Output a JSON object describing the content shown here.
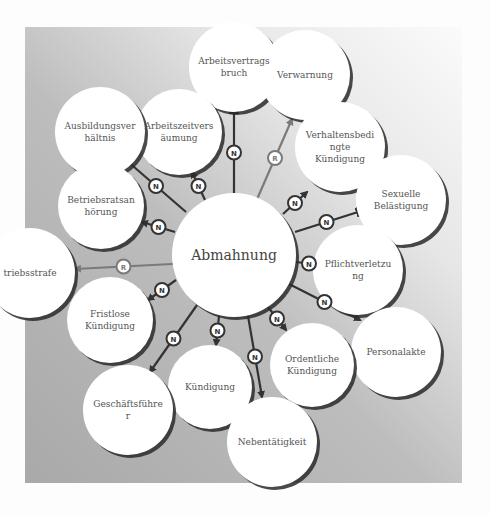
{
  "diagram": {
    "title": "Abmahnung",
    "center": {
      "id": "abmahnung",
      "label": "Abmahnung",
      "cx": 234,
      "cy": 255,
      "r": 62
    },
    "nodes": [
      {
        "id": "arbeitsvertragsbruch",
        "label": "Arbeitsvertrags\nbruch",
        "cx": 234,
        "cy": 67,
        "r": 45
      },
      {
        "id": "verwarnung",
        "label": "Verwarnung",
        "cx": 305,
        "cy": 75,
        "r": 45
      },
      {
        "id": "arbeitszeitversaeumung",
        "label": "Arbeitszeitvers\näumung",
        "cx": 179,
        "cy": 132,
        "r": 43
      },
      {
        "id": "ausbildungsverhaeltnis",
        "label": "Ausbildungsver\nhältnis",
        "cx": 100,
        "cy": 132,
        "r": 45
      },
      {
        "id": "verhaltensbedingte-kuendigung",
        "label": "Verhaltensbedi\nngte\nKündigung",
        "cx": 340,
        "cy": 147,
        "r": 45
      },
      {
        "id": "sexuelle-belaestigung",
        "label": "Sexuelle\nBelästigung",
        "cx": 401,
        "cy": 200,
        "r": 45
      },
      {
        "id": "betriebsratsanhoerung",
        "label": "Betriebsratsan\nhörung",
        "cx": 101,
        "cy": 206,
        "r": 43
      },
      {
        "id": "pflichtverletzung",
        "label": "Pflichtverletzu\nng",
        "cx": 358,
        "cy": 270,
        "r": 45
      },
      {
        "id": "betriebsstrafe",
        "label": "triebsstrafe",
        "cx": 30,
        "cy": 273,
        "r": 45
      },
      {
        "id": "fristlose-kuendigung",
        "label": "Fristlose\nKündigung",
        "cx": 110,
        "cy": 320,
        "r": 43
      },
      {
        "id": "personalakte",
        "label": "Personalakte",
        "cx": 396,
        "cy": 352,
        "r": 45
      },
      {
        "id": "ordentliche-kuendigung",
        "label": "Ordentliche\nKündigung",
        "cx": 312,
        "cy": 365,
        "r": 42
      },
      {
        "id": "kuendigung",
        "label": "Kündigung",
        "cx": 210,
        "cy": 387,
        "r": 42
      },
      {
        "id": "geschaeftsfuehrer",
        "label": "Geschäftsführe\nr",
        "cx": 128,
        "cy": 410,
        "r": 45
      },
      {
        "id": "nebentaetigkeit",
        "label": "Nebentätigkeit",
        "cx": 272,
        "cy": 442,
        "r": 45
      }
    ],
    "edges": [
      {
        "to": "arbeitsvertragsbruch",
        "x1": 234,
        "y1": 193,
        "x2": 234,
        "y2": 112,
        "label": "N",
        "style": "dark",
        "dir": "to-center"
      },
      {
        "to": "verwarnung",
        "x1": 258,
        "y1": 197,
        "x2": 292,
        "y2": 119,
        "label": "R",
        "style": "grey",
        "dir": "both"
      },
      {
        "to": "arbeitszeitversaeumung",
        "x1": 205,
        "y1": 200,
        "x2": 192,
        "y2": 172,
        "label": "N",
        "style": "dark",
        "dir": "outward"
      },
      {
        "to": "ausbildungsverhaeltnis",
        "x1": 186,
        "y1": 212,
        "x2": 126,
        "y2": 160,
        "label": "N",
        "style": "dark",
        "dir": "outward"
      },
      {
        "to": "verhaltensbedingte-kuendigung",
        "x1": 283,
        "y1": 214,
        "x2": 307,
        "y2": 192,
        "label": "N",
        "style": "dark",
        "dir": "outward"
      },
      {
        "to": "sexuelle-belaestigung",
        "x1": 295,
        "y1": 232,
        "x2": 358,
        "y2": 212,
        "label": "N",
        "style": "dark",
        "dir": "to-center"
      },
      {
        "to": "betriebsratsanhoerung",
        "x1": 175,
        "y1": 232,
        "x2": 142,
        "y2": 222,
        "label": "N",
        "style": "dark",
        "dir": "outward"
      },
      {
        "to": "pflichtverletzung",
        "x1": 296,
        "y1": 262,
        "x2": 322,
        "y2": 265,
        "label": "N",
        "style": "dark",
        "dir": "outward"
      },
      {
        "to": "betriebsstrafe",
        "x1": 172,
        "y1": 264,
        "x2": 75,
        "y2": 269,
        "label": "R",
        "style": "grey",
        "dir": "both"
      },
      {
        "to": "personalakte",
        "x1": 289,
        "y1": 284,
        "x2": 360,
        "y2": 320,
        "label": "N",
        "style": "dark",
        "dir": "outward"
      },
      {
        "to": "fristlose-kuendigung",
        "x1": 176,
        "y1": 280,
        "x2": 148,
        "y2": 300,
        "label": "N",
        "style": "dark",
        "dir": "outward"
      },
      {
        "to": "ordentliche-kuendigung",
        "x1": 268,
        "y1": 307,
        "x2": 286,
        "y2": 330,
        "label": "N",
        "style": "dark",
        "dir": "outward"
      },
      {
        "to": "kuendigung",
        "x1": 219,
        "y1": 316,
        "x2": 216,
        "y2": 345,
        "label": "N",
        "style": "dark",
        "dir": "outward"
      },
      {
        "to": "geschaeftsfuehrer",
        "x1": 197,
        "y1": 305,
        "x2": 150,
        "y2": 372,
        "label": "N",
        "style": "dark",
        "dir": "outward"
      },
      {
        "to": "nebentaetigkeit",
        "x1": 248,
        "y1": 316,
        "x2": 262,
        "y2": 397,
        "label": "N",
        "style": "dark",
        "dir": "outward"
      }
    ],
    "colors": {
      "node_fill": "#ffffff",
      "node_shadow": "#2a2a2a",
      "edge_dark": "#333333",
      "edge_grey": "#7a7a7a",
      "text": "#555555"
    }
  }
}
